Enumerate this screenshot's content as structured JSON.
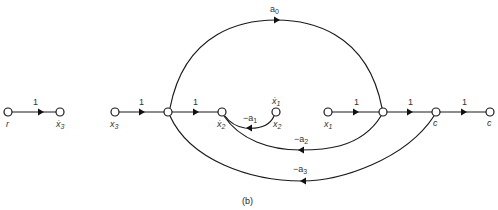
{
  "diagram": {
    "type": "signal-flow-graph",
    "caption": "(b)",
    "left_graph": {
      "nodes": [
        {
          "id": "r",
          "label": "r"
        },
        {
          "id": "x3dot_a",
          "label": "ẋ₃"
        }
      ],
      "edges": [
        {
          "from": "r",
          "to": "x3dot_a",
          "gain": "1"
        }
      ]
    },
    "main_graph": {
      "nodes": [
        {
          "id": "x3",
          "label": "x₃"
        },
        {
          "id": "j1",
          "label": ""
        },
        {
          "id": "x2dot",
          "label": "ẋ₂"
        },
        {
          "id": "x2",
          "label": "x₂",
          "top_label": "ẋ₁"
        },
        {
          "id": "x1",
          "label": "x₁"
        },
        {
          "id": "j2",
          "label": ""
        },
        {
          "id": "c1",
          "label": "c"
        },
        {
          "id": "c2",
          "label": "c"
        }
      ],
      "edges": [
        {
          "from": "x3",
          "to": "j1",
          "gain": "1"
        },
        {
          "from": "j1",
          "to": "x2dot",
          "gain": "1"
        },
        {
          "from": "x2",
          "to": "x2dot",
          "gain": "−a₁"
        },
        {
          "from": "x1",
          "to": "j2",
          "gain": "1"
        },
        {
          "from": "j2",
          "to": "c1",
          "gain": "1"
        },
        {
          "from": "c1",
          "to": "c2",
          "gain": "1"
        },
        {
          "from": "j1",
          "to": "j2",
          "gain": "a₀"
        },
        {
          "from": "j2",
          "to": "x2dot",
          "gain": "−a₂"
        },
        {
          "from": "c1",
          "to": "j1",
          "gain": "−a₃"
        }
      ]
    }
  },
  "labels": {
    "r": "r",
    "x3dot_a": "ẋ",
    "x3dot_a_sub": "3",
    "x3": "x",
    "x3_sub": "3",
    "x2dot": "ẋ",
    "x2dot_sub": "2",
    "x1dot": "ẋ",
    "x1dot_sub": "1",
    "x2": "x",
    "x2_sub": "2",
    "x1": "x",
    "x1_sub": "1",
    "c1": "c",
    "c2": "c"
  },
  "gains": {
    "r_x3dot": "1",
    "x3_j1": "1",
    "j1_x2dot": "1",
    "a1": "−a",
    "a1_sub": "1",
    "x1_j2": "1",
    "j2_c1": "1",
    "c1_c2": "1",
    "a0": "a",
    "a0_sub": "0",
    "a2": "−a",
    "a2_sub": "2",
    "a3": "−a",
    "a3_sub": "3"
  },
  "caption": "(b)"
}
